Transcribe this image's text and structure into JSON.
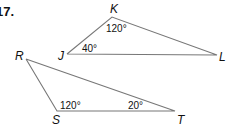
{
  "problem_number": "17.",
  "triangles": [
    {
      "name": "triangle-JKL",
      "vertices": [
        "J",
        "K",
        "L"
      ],
      "angles": {
        "K": "120°",
        "J": "40°"
      }
    },
    {
      "name": "triangle-RST",
      "vertices": [
        "R",
        "S",
        "T"
      ],
      "angles": {
        "S": "120°",
        "T": "20°"
      }
    }
  ]
}
